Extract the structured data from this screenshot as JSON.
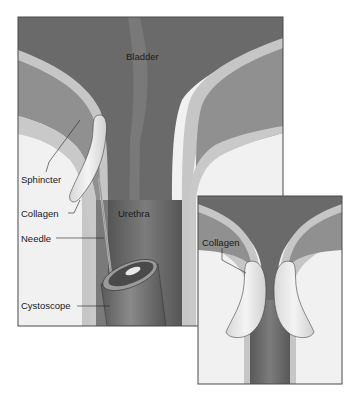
{
  "figure": {
    "main_panel": {
      "labels": {
        "bladder": "Bladder",
        "sphincter": "Sphincter",
        "collagen": "Collagen",
        "urethra": "Urethra",
        "needle": "Needle",
        "cystoscope": "Cystoscope"
      }
    },
    "inset_panel": {
      "labels": {
        "collagen": "Collagen"
      }
    },
    "colors": {
      "lumen_dark": "#5e5e5e",
      "lumen_mid": "#7a7a7a",
      "muscle": "#8e8e8e",
      "wall_light": "#c4c4c4",
      "tissue_white": "#f2f2f2",
      "collagen": "#e6e6e6",
      "frame": "#4a4a4a"
    }
  }
}
